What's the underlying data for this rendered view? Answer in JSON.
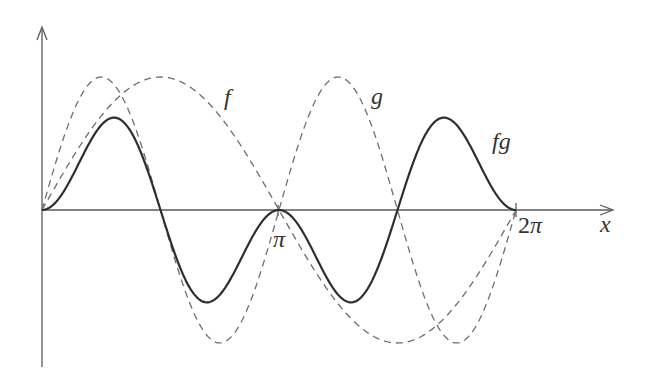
{
  "chart_data": {
    "type": "line",
    "title": "",
    "xlabel": "x",
    "ylabel": "",
    "xlim": [
      0,
      6.2832
    ],
    "ylim": [
      -1,
      1
    ],
    "grid": false,
    "legend": "inline labels",
    "x_ticks": [
      {
        "value": 3.1416,
        "label": "π"
      },
      {
        "value": 6.2832,
        "label": "2π"
      }
    ],
    "series": [
      {
        "name": "f",
        "formula": "sin(x)",
        "style": "dashed",
        "label_pos": [
          230,
          105
        ],
        "x": [
          0,
          0.7854,
          1.5708,
          2.3562,
          3.1416,
          3.927,
          4.7124,
          5.4978,
          6.2832
        ],
        "values": [
          0,
          0.707,
          1,
          0.707,
          0,
          -0.707,
          -1,
          -0.707,
          0
        ]
      },
      {
        "name": "g",
        "formula": "sin(2x)",
        "style": "dashed",
        "label_pos": [
          378,
          104
        ],
        "x": [
          0,
          0.7854,
          1.5708,
          2.3562,
          3.1416,
          3.927,
          4.7124,
          5.4978,
          6.2832
        ],
        "values": [
          0,
          1,
          0,
          -1,
          0,
          1,
          0,
          -1,
          0
        ]
      },
      {
        "name": "fg",
        "formula": "sin(x)·sin(2x)",
        "style": "solid",
        "label_pos": [
          504,
          149
        ],
        "x": [
          0,
          0.955,
          1.5708,
          2.186,
          3.1416,
          4.097,
          4.7124,
          5.328,
          6.2832
        ],
        "values": [
          0,
          0.77,
          0,
          -0.77,
          0,
          -0.77,
          0,
          0.77,
          0
        ]
      }
    ]
  },
  "labels": {
    "x_axis": "x",
    "pi": "π",
    "two_pi_num": "2",
    "two_pi_sym": "π",
    "f": "f",
    "g": "g",
    "fg": "fg"
  }
}
